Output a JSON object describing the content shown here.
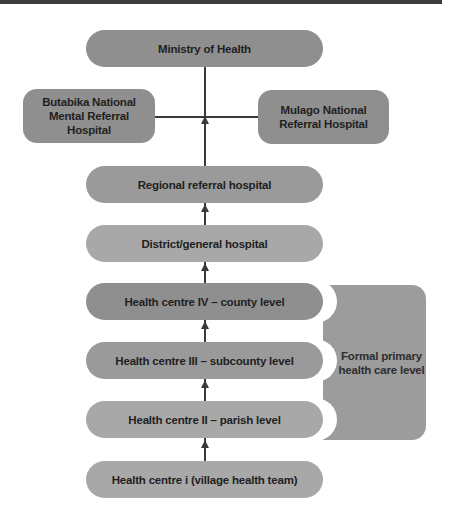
{
  "diagram": {
    "type": "hierarchy",
    "title": "",
    "nodes": {
      "ministry": "Ministry of Health",
      "butabika": "Butabika National Mental Referral Hospital",
      "mulago": "Mulago National Referral Hospital",
      "regional": "Regional referral hospital",
      "district": "District/general hospital",
      "hc4": "Health centre IV – county level",
      "hc3": "Health centre III – subcounty level",
      "hc2": "Health centre II – parish level",
      "hc1": "Health centre i (village health team)"
    },
    "bracket": {
      "label": "Formal primary health care level",
      "groups": [
        "hc4",
        "hc3",
        "hc2"
      ]
    },
    "edges": [
      {
        "from": "hc1",
        "to": "hc2"
      },
      {
        "from": "hc2",
        "to": "hc3"
      },
      {
        "from": "hc3",
        "to": "hc4"
      },
      {
        "from": "hc4",
        "to": "district"
      },
      {
        "from": "district",
        "to": "regional"
      },
      {
        "from": "regional",
        "to": "ministry"
      },
      {
        "from": "butabika",
        "to": "ministry",
        "type": "line"
      },
      {
        "from": "mulago",
        "to": "ministry",
        "type": "line"
      }
    ],
    "colors": {
      "node_dark": "#8f8f8f",
      "node_light": "#a8a8a8",
      "bracket": "#9c9c9c",
      "text": "#1f1f1f",
      "connector": "#3a3a3a",
      "topbar": "#3c3c3c"
    }
  }
}
